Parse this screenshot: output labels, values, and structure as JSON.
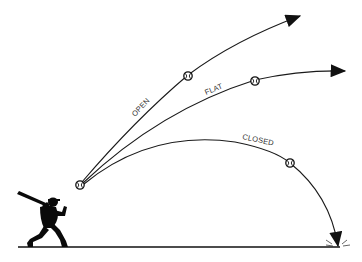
{
  "diagram": {
    "title": "",
    "colors": {
      "background": "#ffffff",
      "line": "#1a1a1a",
      "silhouette": "#0a0a0a",
      "label": "#333333"
    },
    "trajectories": [
      {
        "id": "open",
        "label": "OPEN",
        "outcome": "rising flight, arrow up-right"
      },
      {
        "id": "flat",
        "label": "FLAT",
        "outcome": "level flight, arrow right"
      },
      {
        "id": "closed",
        "label": "CLOSED",
        "outcome": "drops to ground"
      }
    ],
    "elements": {
      "batter": "batter-silhouette",
      "ball_icon": "baseball-icon",
      "ground": "ground-line"
    }
  }
}
